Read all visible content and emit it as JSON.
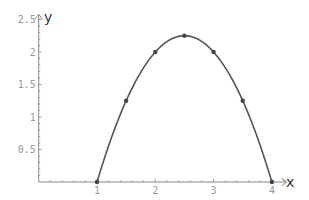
{
  "chart_data": {
    "type": "line",
    "title": "",
    "xlabel": "x",
    "ylabel": "y",
    "function": "y = -(x-1)(x-4)",
    "x_ticks": [
      "1",
      "2",
      "3",
      "4"
    ],
    "y_ticks": [
      "0.5",
      "1",
      "1.5",
      "2",
      "2.5"
    ],
    "xlim": [
      0,
      4.2
    ],
    "ylim": [
      0,
      2.5
    ],
    "grid": false,
    "series": [
      {
        "name": "curve",
        "x": [
          1,
          1.5,
          2,
          2.5,
          3,
          3.5,
          4
        ],
        "y": [
          0,
          1.25,
          2,
          2.25,
          2,
          1.25,
          0
        ]
      }
    ],
    "markers": {
      "x": [
        1,
        1.5,
        2,
        2.5,
        3,
        3.5,
        4
      ],
      "y": [
        0,
        1.25,
        2,
        2.25,
        2,
        1.25,
        0
      ]
    },
    "colors": {
      "curve": "#555555",
      "axis": "#888888",
      "tick_label": "#9a9a9a"
    }
  }
}
